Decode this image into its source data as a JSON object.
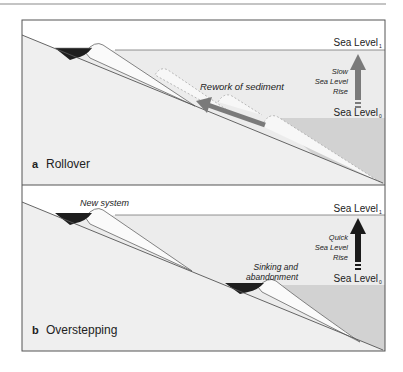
{
  "figure": {
    "panels": [
      {
        "letter": "a",
        "title": "Rollover",
        "sea_level_top": "Sea Level",
        "sea_level_top_sub": "1",
        "sea_level_bottom": "Sea Level",
        "sea_level_bottom_sub": "0",
        "rise_label_line1": "Slow",
        "rise_label_line2": "Sea Level",
        "rise_label_line3": "Rise",
        "annotation": "Rework of sediment",
        "arrow_color": "#7a7a7a"
      },
      {
        "letter": "b",
        "title": "Overstepping",
        "sea_level_top": "Sea Level",
        "sea_level_top_sub": "1",
        "sea_level_bottom": "Sea Level",
        "sea_level_bottom_sub": "0",
        "rise_label_line1": "Quick",
        "rise_label_line2": "Sea Level",
        "rise_label_line3": "Rise",
        "annotation_new": "New system",
        "annotation_sink_line1": "Sinking and",
        "annotation_sink_line2": "abandonment",
        "arrow_color": "#1a1a1a"
      }
    ],
    "colors": {
      "water_light": "#e9e9e9",
      "water_deep": "#d4d4d4",
      "sediment": "#fbfbfb",
      "lagoon": "#1e1e1e",
      "frame": "#555555"
    }
  }
}
